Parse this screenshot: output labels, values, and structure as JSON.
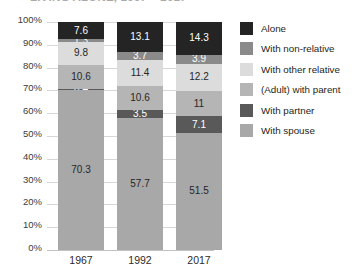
{
  "title": {
    "text": "LIVING ALONE, 1967 – 2017",
    "visible": "partially-cropped"
  },
  "chart_data": {
    "type": "bar",
    "stacked": true,
    "title": "LIVING ALONE, 1967 – 2017",
    "xlabel": "",
    "ylabel": "",
    "ylim": [
      0,
      100
    ],
    "grid": true,
    "legend_position": "right",
    "categories": [
      "1967",
      "1992",
      "2017"
    ],
    "ytick_labels": [
      "100%",
      "90%",
      "80%",
      "70%",
      "60%",
      "50%",
      "40%",
      "30%",
      "20%",
      "10%",
      "0%"
    ],
    "ytick_values": [
      100,
      90,
      80,
      70,
      60,
      50,
      40,
      30,
      20,
      10,
      0
    ],
    "series": [
      {
        "name": "With spouse",
        "color": "#a8a8a8",
        "values": [
          70.3,
          57.7,
          51.5
        ],
        "labels": [
          "70.3",
          "57.7",
          "51.5"
        ]
      },
      {
        "name": "With partner",
        "color": "#595959",
        "values": [
          0.4,
          3.5,
          7.1
        ],
        "labels": [
          "0.4",
          "3.5",
          "7.1"
        ]
      },
      {
        "name": "(Adult) with parent",
        "color": "#b5b5b5",
        "values": [
          10.6,
          10.6,
          11
        ],
        "labels": [
          "10.6",
          "10.6",
          "11"
        ]
      },
      {
        "name": "With other relative",
        "color": "#dcdcdc",
        "values": [
          9.8,
          11.4,
          12.2
        ],
        "labels": [
          "9.8",
          "11.4",
          "12.2"
        ]
      },
      {
        "name": "With non-relative",
        "color": "#8a8a8a",
        "values": [
          1.3,
          3.7,
          3.9
        ],
        "labels": [
          "1.3",
          "3.7",
          "3.9"
        ]
      },
      {
        "name": "Alone",
        "color": "#242424",
        "values": [
          7.6,
          13.1,
          14.3
        ],
        "labels": [
          "7.6",
          "13.1",
          "14.3"
        ]
      }
    ],
    "legend_order": [
      "Alone",
      "With non-relative",
      "With other relative",
      "(Adult) with parent",
      "With partner",
      "With spouse"
    ]
  },
  "colors": {
    "alone": "#242424",
    "with_non_relative": "#8a8a8a",
    "with_other_relative": "#dcdcdc",
    "adult_with_parent": "#b5b5b5",
    "with_partner": "#595959",
    "with_spouse": "#a8a8a8",
    "gridline": "#d7d7d7",
    "background": "#ffffff",
    "text": "#231f20"
  }
}
